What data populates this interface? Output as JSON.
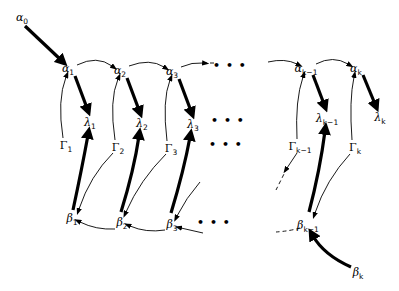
{
  "diagram": {
    "nodes": [
      {
        "id": "alpha0",
        "sym": "α",
        "sub": "0",
        "x": 22,
        "y": 17,
        "italic": true
      },
      {
        "id": "alpha1",
        "sym": "α",
        "sub": "1",
        "x": 68,
        "y": 68,
        "italic": true
      },
      {
        "id": "alpha2",
        "sym": "α",
        "sub": "2",
        "x": 120,
        "y": 70,
        "italic": true
      },
      {
        "id": "alpha3",
        "sym": "α",
        "sub": "3",
        "x": 172,
        "y": 71,
        "italic": true
      },
      {
        "id": "alphak1",
        "sym": "α",
        "sub": "k−1",
        "x": 306,
        "y": 68,
        "italic": true
      },
      {
        "id": "alphak",
        "sym": "α",
        "sub": "k",
        "x": 356,
        "y": 68,
        "italic": true
      },
      {
        "id": "lambda1",
        "sym": "λ",
        "sub": "1",
        "x": 90,
        "y": 122,
        "italic": true
      },
      {
        "id": "lambda2",
        "sym": "λ",
        "sub": "2",
        "x": 142,
        "y": 123,
        "italic": true
      },
      {
        "id": "lambda3",
        "sym": "λ",
        "sub": "3",
        "x": 193,
        "y": 124,
        "italic": true
      },
      {
        "id": "lambdak1",
        "sym": "λ",
        "sub": "k−1",
        "x": 327,
        "y": 118,
        "italic": true
      },
      {
        "id": "lambdak",
        "sym": "λ",
        "sub": "k",
        "x": 380,
        "y": 117,
        "italic": true
      },
      {
        "id": "gamma1",
        "sym": "Γ",
        "sub": "1",
        "x": 66,
        "y": 145,
        "italic": false
      },
      {
        "id": "gamma2",
        "sym": "Γ",
        "sub": "2",
        "x": 118,
        "y": 147,
        "italic": false
      },
      {
        "id": "gamma3",
        "sym": "Γ",
        "sub": "3",
        "x": 171,
        "y": 148,
        "italic": false
      },
      {
        "id": "gammak1",
        "sym": "Γ",
        "sub": "k−1",
        "x": 300,
        "y": 146,
        "italic": false
      },
      {
        "id": "gammak",
        "sym": "Γ",
        "sub": "k",
        "x": 355,
        "y": 147,
        "italic": false
      },
      {
        "id": "beta1",
        "sym": "β",
        "sub": "1",
        "x": 72,
        "y": 218,
        "italic": true
      },
      {
        "id": "beta2",
        "sym": "β",
        "sub": "2",
        "x": 122,
        "y": 222,
        "italic": true
      },
      {
        "id": "beta3",
        "sym": "β",
        "sub": "3",
        "x": 172,
        "y": 224,
        "italic": true
      },
      {
        "id": "betak1",
        "sym": "β",
        "sub": "k−1",
        "x": 308,
        "y": 225,
        "italic": true
      },
      {
        "id": "betak",
        "sym": "β",
        "sub": "k",
        "x": 358,
        "y": 272,
        "italic": true
      }
    ],
    "ellipses": [
      {
        "id": "dots-alpha-row",
        "text": "• • •",
        "x": 230,
        "y": 66
      },
      {
        "id": "dots-lambda-row",
        "text": "• • •",
        "x": 228,
        "y": 121
      },
      {
        "id": "dots-gamma-row",
        "text": "• • •",
        "x": 226,
        "y": 145
      },
      {
        "id": "dots-beta-row",
        "text": "• • •",
        "x": 214,
        "y": 223
      }
    ],
    "edges": [
      {
        "from": "alpha0",
        "to": "alpha1",
        "weight": "thick",
        "d": "M25,26 L61,60"
      },
      {
        "from": "alpha1",
        "to": "lambda1",
        "weight": "thick",
        "d": "M75,76 L87,108"
      },
      {
        "from": "alpha2",
        "to": "lambda2",
        "weight": "thick",
        "d": "M127,78 L139,110"
      },
      {
        "from": "alpha3",
        "to": "lambda3",
        "weight": "thick",
        "d": "M179,79 L191,111"
      },
      {
        "from": "alphak1",
        "to": "lambdak1",
        "weight": "thick",
        "d": "M313,75 L324,104"
      },
      {
        "from": "alphak",
        "to": "lambdak",
        "weight": "thick",
        "d": "M363,75 L375,104"
      },
      {
        "from": "beta1",
        "to": "lambda1",
        "weight": "thick",
        "d": "M73,210 Q82,168 88,135"
      },
      {
        "from": "beta2",
        "to": "lambda2",
        "weight": "thick",
        "d": "M121,212 Q134,170 139,136"
      },
      {
        "from": "beta3",
        "to": "lambda3",
        "weight": "thick",
        "d": "M171,213 Q184,170 190,137"
      },
      {
        "from": "betak1",
        "to": "lambdak1",
        "weight": "thick",
        "d": "M309,212 Q320,170 325,131"
      },
      {
        "from": "betak",
        "to": "betak1",
        "weight": "thick",
        "d": "M351,267 Q324,255 313,236"
      },
      {
        "from": "alpha1",
        "to": "alpha2",
        "weight": "thin",
        "d": "M77,65 Q97,55 112,66"
      },
      {
        "from": "alpha2",
        "to": "alpha3",
        "weight": "thin",
        "d": "M129,66 Q150,58 164,67"
      },
      {
        "from": "alpha3",
        "to": "dots",
        "weight": "thin",
        "d": "M181,67 Q192,62 203,63"
      },
      {
        "from": "alpha3",
        "to": "dots",
        "weight": "dashed",
        "d": "M203,63 L214,63"
      },
      {
        "from": "dots",
        "to": "alphak1",
        "weight": "thin",
        "d": "M268,62 Q285,58 297,64"
      },
      {
        "from": "alphak1",
        "to": "alphak",
        "weight": "thin",
        "d": "M316,64 Q333,55 348,64"
      },
      {
        "from": "gamma1",
        "to": "alpha1",
        "weight": "thin",
        "d": "M63,138 Q57,100 66,77"
      },
      {
        "from": "gamma2",
        "to": "alpha2",
        "weight": "thin",
        "d": "M115,140 Q109,100 118,79"
      },
      {
        "from": "gamma3",
        "to": "alpha3",
        "weight": "thin",
        "d": "M167,141 Q162,100 170,80"
      },
      {
        "from": "gammak1",
        "to": "alphak1",
        "weight": "thin",
        "d": "M297,139 Q295,100 303,77"
      },
      {
        "from": "gammak",
        "to": "alphak",
        "weight": "thin",
        "d": "M352,140 Q349,100 354,77"
      },
      {
        "from": "gamma2",
        "to": "beta1",
        "weight": "thin",
        "d": "M113,153 Q90,176 79,209"
      },
      {
        "from": "gamma3",
        "to": "beta2",
        "weight": "thin",
        "d": "M166,154 Q140,180 126,212"
      },
      {
        "from": "gamma4",
        "to": "beta3",
        "weight": "thin",
        "d": "M200,182 Q186,198 177,216"
      },
      {
        "from": "gammak1",
        "to": "dots",
        "weight": "thin",
        "d": "M297,153 L287,168"
      },
      {
        "from": "gammak1",
        "to": "dots",
        "weight": "dashed",
        "d": "M287,168 L276,190"
      },
      {
        "from": "gammak",
        "to": "betak1",
        "weight": "thin",
        "d": "M350,154 Q326,180 315,213"
      },
      {
        "from": "beta2",
        "to": "beta1",
        "weight": "thin",
        "d": "M115,229 Q96,230 80,222"
      },
      {
        "from": "beta3",
        "to": "beta2",
        "weight": "thin",
        "d": "M165,230 Q146,233 130,226"
      },
      {
        "from": "dots",
        "to": "beta3",
        "weight": "thin",
        "d": "M203,233 L181,228"
      },
      {
        "from": "betak1",
        "to": "dots",
        "weight": "dashed",
        "d": "M300,228 Q290,231 276,232",
        "noarrow": true
      }
    ]
  }
}
